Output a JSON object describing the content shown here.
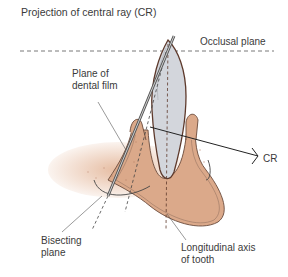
{
  "title": "Projection of central ray (CR)",
  "labels": {
    "occlusal_plane": "Occlusal plane",
    "dental_film_line1": "Plane of",
    "dental_film_line2": "dental film",
    "central_ray": "CR",
    "bisecting_line1": "Bisecting",
    "bisecting_line2": "plane",
    "long_axis_line1": "Longitudinal axis",
    "long_axis_line2": "of tooth"
  },
  "colors": {
    "bone": "#dba98a",
    "bone_stipple": "#c98d6c",
    "tooth": "#d3d6dc",
    "tooth_outline": "#5e3a2c",
    "lines": "#333333",
    "film": "#777777"
  }
}
